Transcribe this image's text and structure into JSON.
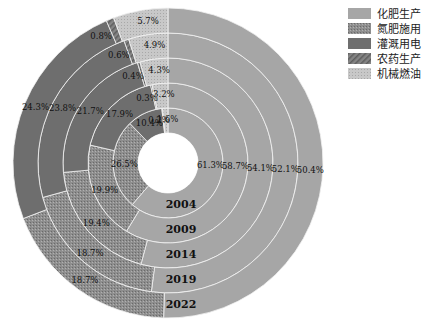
{
  "chart_data": {
    "type": "pie",
    "subtype": "multi-ring donut",
    "title": "",
    "categories": [
      "化肥生产",
      "氮肥施用",
      "灌溉用电",
      "农药生产",
      "机械燃油"
    ],
    "rings": [
      {
        "label": "2004",
        "values": [
          61.3,
          26.5,
          10.4,
          0.2,
          1.6
        ]
      },
      {
        "label": "2009",
        "values": [
          58.7,
          19.9,
          17.9,
          0.3,
          3.2
        ]
      },
      {
        "label": "2014",
        "values": [
          54.1,
          19.4,
          21.7,
          0.4,
          4.3
        ]
      },
      {
        "label": "2019",
        "values": [
          52.1,
          18.7,
          23.8,
          0.6,
          4.9
        ]
      },
      {
        "label": "2022",
        "values": [
          50.4,
          18.7,
          24.3,
          0.8,
          5.7
        ]
      }
    ],
    "unit": "%",
    "ring_order": "inner to outer",
    "start_angle": "12 o'clock, clockwise",
    "legend_position": "top-right"
  },
  "legend": {
    "items": [
      {
        "label": "化肥生产",
        "color": "#a6a6a6",
        "pattern": "solid"
      },
      {
        "label": "氮肥施用",
        "color": "#8a8a8a",
        "pattern": "dots"
      },
      {
        "label": "灌溉用电",
        "color": "#6e6e6e",
        "pattern": "solid"
      },
      {
        "label": "农药生产",
        "color": "#7a7a7a",
        "pattern": "diagonal"
      },
      {
        "label": "机械燃油",
        "color": "#c4c4c4",
        "pattern": "dots-light"
      }
    ]
  }
}
